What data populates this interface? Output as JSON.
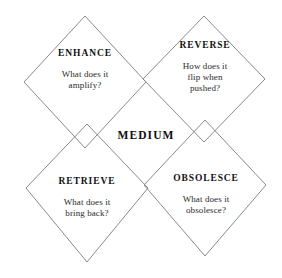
{
  "diagram": {
    "type": "mcluhan-tetrad",
    "center_label": "MEDIUM",
    "background_color": "#ffffff",
    "line_color": "#8a8a8a",
    "text_color": "#1a1a1a",
    "quadrants": [
      {
        "id": "enhance",
        "title": "ENHANCE",
        "position": "top-left",
        "question_lines": [
          "What does it",
          "amplify?"
        ]
      },
      {
        "id": "reverse",
        "title": "REVERSE",
        "position": "top-right",
        "question_lines": [
          "How does it",
          "flip when",
          "pushed?"
        ]
      },
      {
        "id": "retrieve",
        "title": "RETRIEVE",
        "position": "bottom-left",
        "question_lines": [
          "What does it",
          "bring back?"
        ]
      },
      {
        "id": "obsolesce",
        "title": "OBSOLESCE",
        "position": "bottom-right",
        "question_lines": [
          "What does it",
          "obsolesce?"
        ]
      }
    ]
  }
}
